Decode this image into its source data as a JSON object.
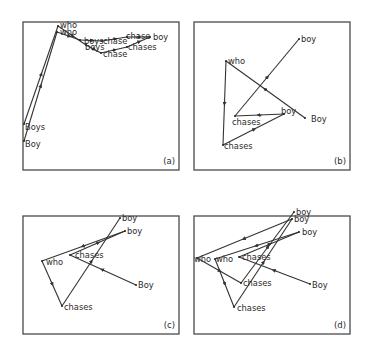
{
  "figure": {
    "panels": [
      {
        "id": "a",
        "label": "(a)",
        "box": [
          23,
          22,
          156,
          148
        ],
        "points": [
          {
            "word": "who",
            "x": 58,
            "y": 26,
            "tx": 60,
            "ty": 28
          },
          {
            "word": "who",
            "x": 57,
            "y": 32,
            "tx": 60,
            "ty": 35
          },
          {
            "word": "boys",
            "x": 80,
            "y": 40,
            "tx": 84,
            "ty": 44
          },
          {
            "word": "chase",
            "x": 102,
            "y": 41,
            "tx": 103,
            "ty": 44
          },
          {
            "word": "chase",
            "x": 127,
            "y": 37,
            "tx": 126,
            "ty": 39
          },
          {
            "word": "boy",
            "x": 150,
            "y": 37,
            "tx": 153,
            "ty": 40
          },
          {
            "word": "boys",
            "x": 86,
            "y": 45,
            "tx": 85,
            "ty": 50
          },
          {
            "word": "chase",
            "x": 101,
            "y": 53,
            "tx": 103,
            "ty": 57
          },
          {
            "word": "chases",
            "x": 127,
            "y": 47,
            "tx": 128,
            "ty": 50
          },
          {
            "word": "Boys",
            "x": 24,
            "y": 124,
            "tx": 25,
            "ty": 130
          },
          {
            "word": "Boy",
            "x": 24,
            "y": 141,
            "tx": 25,
            "ty": 147
          }
        ],
        "paths": [
          [
            [
              24,
              141
            ],
            [
              57,
              32
            ],
            [
              80,
              40
            ],
            [
              102,
              41
            ],
            [
              127,
              37
            ],
            [
              150,
              37
            ]
          ],
          [
            [
              24,
              124
            ],
            [
              58,
              26
            ],
            [
              86,
              45
            ],
            [
              101,
              53
            ],
            [
              127,
              47
            ],
            [
              150,
              37
            ]
          ]
        ]
      },
      {
        "id": "b",
        "label": "(b)",
        "box": [
          194,
          22,
          156,
          148
        ],
        "points": [
          {
            "word": "boy",
            "x": 299,
            "y": 39,
            "tx": 301,
            "ty": 42
          },
          {
            "word": "who",
            "x": 226,
            "y": 61,
            "tx": 228,
            "ty": 64
          },
          {
            "word": "boy",
            "x": 284,
            "y": 114,
            "tx": 281,
            "ty": 114
          },
          {
            "word": "Boy",
            "x": 305,
            "y": 118,
            "tx": 311,
            "ty": 122
          },
          {
            "word": "chases",
            "x": 235,
            "y": 116,
            "tx": 232,
            "ty": 125
          },
          {
            "word": "chases",
            "x": 223,
            "y": 145,
            "tx": 224,
            "ty": 149
          }
        ],
        "paths": [
          [
            [
              305,
              118
            ],
            [
              226,
              61
            ],
            [
              223,
              145
            ],
            [
              284,
              114
            ],
            [
              235,
              116
            ],
            [
              299,
              39
            ]
          ]
        ]
      },
      {
        "id": "c",
        "label": "(c)",
        "box": [
          23,
          216,
          156,
          118
        ],
        "points": [
          {
            "word": "boy",
            "x": 120,
            "y": 218,
            "tx": 122,
            "ty": 221
          },
          {
            "word": "boy",
            "x": 125,
            "y": 231,
            "tx": 127,
            "ty": 234
          },
          {
            "word": "chases",
            "x": 70,
            "y": 255,
            "tx": 75,
            "ty": 258
          },
          {
            "word": "who",
            "x": 42,
            "y": 261,
            "tx": 46,
            "ty": 265
          },
          {
            "word": "Boy",
            "x": 136,
            "y": 285,
            "tx": 138,
            "ty": 288
          },
          {
            "word": "chases",
            "x": 62,
            "y": 306,
            "tx": 64,
            "ty": 310
          }
        ],
        "paths": [
          [
            [
              136,
              285
            ],
            [
              70,
              255
            ],
            [
              125,
              231
            ],
            [
              42,
              261
            ],
            [
              62,
              306
            ],
            [
              120,
              218
            ]
          ]
        ]
      },
      {
        "id": "d",
        "label": "(d)",
        "box": [
          194,
          216,
          156,
          118
        ],
        "points": [
          {
            "word": "boy",
            "x": 294,
            "y": 212,
            "tx": 296,
            "ty": 215
          },
          {
            "word": "boy",
            "x": 292,
            "y": 219,
            "tx": 294,
            "ty": 222
          },
          {
            "word": "boy",
            "x": 299,
            "y": 232,
            "tx": 302,
            "ty": 235
          },
          {
            "word": "who",
            "x": 197,
            "y": 258,
            "tx": 194,
            "ty": 262
          },
          {
            "word": "who",
            "x": 215,
            "y": 259,
            "tx": 216,
            "ty": 262
          },
          {
            "word": "chases",
            "x": 239,
            "y": 257,
            "tx": 242,
            "ty": 260
          },
          {
            "word": "chases",
            "x": 241,
            "y": 283,
            "tx": 243,
            "ty": 286
          },
          {
            "word": "Boy",
            "x": 310,
            "y": 284,
            "tx": 312,
            "ty": 288
          },
          {
            "word": "chases",
            "x": 234,
            "y": 307,
            "tx": 237,
            "ty": 311
          }
        ],
        "paths": [
          [
            [
              310,
              284
            ],
            [
              239,
              257
            ],
            [
              299,
              232
            ],
            [
              215,
              259
            ],
            [
              234,
              307
            ],
            [
              292,
              219
            ],
            [
              197,
              258
            ],
            [
              241,
              283
            ],
            [
              294,
              212
            ]
          ]
        ]
      }
    ]
  }
}
